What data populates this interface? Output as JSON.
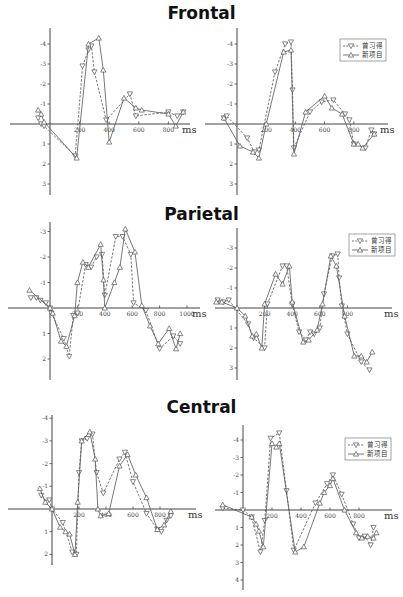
{
  "chart_data": [
    {
      "type": "line",
      "title": "Frontal",
      "panel": "left",
      "xlabel": "ms",
      "ylabel": "",
      "y_inverted": true,
      "xlim": [
        -100,
        1000
      ],
      "ylim": [
        -4.5,
        3.5
      ],
      "x_ticks": [
        200,
        400,
        600,
        800
      ],
      "y_ticks": [
        -4,
        -3,
        -2,
        -1,
        1,
        2,
        3
      ],
      "legend": false,
      "series": [
        {
          "name": "曾习得",
          "style": "dashed",
          "marker": "triangle-down",
          "x": [
            -80,
            -60,
            -40,
            170,
            220,
            260,
            280,
            300,
            380,
            540,
            580,
            800,
            860,
            900
          ],
          "y": [
            -0.3,
            0,
            0.1,
            1.6,
            -2.9,
            -3.7,
            -3.9,
            -2.6,
            -0.2,
            -1.5,
            -0.4,
            -0.6,
            -0.4,
            -0.6
          ]
        },
        {
          "name": "新项目",
          "style": "solid",
          "marker": "triangle-up",
          "x": [
            -80,
            -60,
            -40,
            180,
            260,
            330,
            360,
            400,
            500,
            580,
            620,
            800,
            850,
            900
          ],
          "y": [
            -0.7,
            -0.5,
            -0.1,
            1.7,
            -4.0,
            -4.3,
            -2.7,
            0.9,
            -1.3,
            -0.8,
            -0.7,
            -0.5,
            0.1,
            -0.6
          ]
        }
      ]
    },
    {
      "type": "line",
      "title": "Frontal",
      "panel": "right",
      "xlabel": "ms",
      "ylabel": "",
      "y_inverted": true,
      "xlim": [
        -100,
        1000
      ],
      "ylim": [
        -4.5,
        3.5
      ],
      "x_ticks": [
        200,
        400,
        600,
        800
      ],
      "y_ticks": [
        -4,
        -3,
        -2,
        -1,
        1,
        2,
        3
      ],
      "legend": true,
      "legend_position": "upper right",
      "series": [
        {
          "name": "曾习得",
          "style": "dashed",
          "marker": "triangle-down",
          "x": [
            -90,
            -70,
            70,
            120,
            150,
            260,
            330,
            370,
            380,
            390,
            500,
            580,
            660,
            740,
            770,
            800,
            880,
            920,
            940
          ],
          "y": [
            -0.3,
            -0.4,
            0.7,
            1.4,
            1.3,
            -2.6,
            -4.0,
            -4.1,
            -1.7,
            1.2,
            -0.6,
            -1.1,
            -1.2,
            -0.5,
            -0.2,
            1.0,
            1.2,
            0.3,
            0.5
          ],
          "note": "approximate"
        },
        {
          "name": "新项目",
          "style": "solid",
          "marker": "triangle-up",
          "x": [
            -90,
            20,
            110,
            150,
            200,
            320,
            370,
            390,
            470,
            600,
            650,
            720,
            800,
            830,
            860,
            940
          ],
          "y": [
            -0.3,
            1.1,
            1.4,
            1.7,
            0,
            -3.6,
            -3.7,
            1.5,
            -0.6,
            -1.4,
            -0.8,
            -0.5,
            1.0,
            1.0,
            1.2,
            0.5
          ]
        }
      ]
    },
    {
      "type": "line",
      "title": "Parietal",
      "panel": "left",
      "xlabel": "ms",
      "ylabel": "",
      "y_inverted": true,
      "xlim": [
        -150,
        1100
      ],
      "ylim": [
        -3.3,
        2.8
      ],
      "x_ticks": [
        200,
        400,
        600,
        800,
        1000
      ],
      "y_ticks": [
        -3,
        -2,
        -1,
        1,
        2
      ],
      "legend": false,
      "series": [
        {
          "name": "曾习得",
          "style": "dashed",
          "marker": "triangle-down",
          "x": [
            -140,
            -100,
            -70,
            -30,
            0,
            10,
            100,
            140,
            170,
            200,
            260,
            300,
            340,
            380,
            400,
            480,
            530,
            590,
            610,
            700,
            800,
            900,
            950
          ],
          "y": [
            -0.4,
            -0.4,
            -0.3,
            -0.2,
            0,
            0.2,
            1.2,
            1.9,
            0.3,
            0.2,
            -1.7,
            -1.6,
            -2.0,
            -2.1,
            -0.5,
            -2.8,
            -2.8,
            -2.1,
            -0.2,
            0.1,
            1.6,
            1.1,
            1.4
          ],
          "note": "approximate"
        },
        {
          "name": "新项目",
          "style": "solid",
          "marker": "triangle-up",
          "x": [
            -150,
            0,
            20,
            80,
            120,
            180,
            200,
            240,
            280,
            370,
            390,
            400,
            470,
            510,
            550,
            620,
            670,
            730,
            790,
            870,
            920,
            950
          ],
          "y": [
            -0.7,
            0,
            0.2,
            1.3,
            1.5,
            0.3,
            -1.0,
            -1.8,
            -1.6,
            -2.5,
            -1.1,
            0,
            -1.0,
            -1.6,
            -3.1,
            -2.2,
            -0.1,
            0.7,
            1.4,
            0.8,
            1.6,
            1.0
          ]
        }
      ]
    },
    {
      "type": "line",
      "title": "Parietal",
      "panel": "right",
      "xlabel": "ms",
      "ylabel": "",
      "y_inverted": true,
      "xlim": [
        -150,
        1000
      ],
      "ylim": [
        -3.8,
        3.3
      ],
      "x_ticks": [
        200,
        400,
        600,
        800
      ],
      "y_ticks": [
        -3,
        -2,
        -1,
        1,
        2,
        3
      ],
      "legend": true,
      "legend_position": "upper right",
      "series": [
        {
          "name": "曾习得",
          "style": "dashed",
          "marker": "triangle-down",
          "x": [
            -140,
            -100,
            -60,
            80,
            120,
            200,
            220,
            330,
            360,
            400,
            450,
            500,
            530,
            560,
            600,
            630,
            690,
            730,
            740,
            760,
            800,
            900,
            960
          ],
          "y": [
            -0.4,
            -0.3,
            -0.4,
            0.8,
            1.5,
            2.0,
            -0.2,
            -2.1,
            -2.1,
            -0.2,
            1.2,
            1.6,
            1.2,
            1.3,
            1.0,
            -0.7,
            -2.6,
            -2.7,
            -1.5,
            -0.1,
            1.3,
            2.7,
            3.1
          ],
          "note": "approximate"
        },
        {
          "name": "新项目",
          "style": "solid",
          "marker": "triangle-up",
          "x": [
            -150,
            -110,
            0,
            60,
            110,
            140,
            180,
            200,
            280,
            330,
            380,
            400,
            480,
            520,
            580,
            620,
            680,
            720,
            780,
            850,
            900,
            940,
            980
          ],
          "y": [
            -0.3,
            -0.3,
            0,
            0.4,
            1.4,
            1.3,
            2.0,
            -0.2,
            -1.7,
            -1.2,
            -2.1,
            -0.3,
            1.7,
            1.6,
            1.1,
            -0.2,
            -2.6,
            -2.1,
            0.4,
            2.4,
            2.4,
            2.7,
            2.2
          ]
        }
      ]
    },
    {
      "type": "line",
      "title": "Central",
      "panel": "left",
      "xlabel": "ms",
      "ylabel": "",
      "y_inverted": true,
      "xlim": [
        -100,
        1000
      ],
      "ylim": [
        -4.2,
        2.5
      ],
      "x_ticks": [
        200,
        400,
        600,
        800
      ],
      "y_ticks": [
        -4,
        -3,
        -2,
        -1,
        1,
        2
      ],
      "legend": false,
      "series": [
        {
          "name": "曾习得",
          "style": "dashed",
          "marker": "triangle-down",
          "x": [
            -80,
            -40,
            -20,
            0,
            80,
            150,
            180,
            200,
            220,
            260,
            300,
            330,
            380,
            500,
            540,
            600,
            700,
            780,
            810,
            850,
            880
          ],
          "y": [
            -0.6,
            -0.3,
            -0.4,
            0,
            0.6,
            1.9,
            2.0,
            -1.6,
            -3.0,
            -3.1,
            -3.3,
            -1.6,
            -0.7,
            -2.2,
            -2.5,
            -1.2,
            0.2,
            0.9,
            1.0,
            0.5,
            0.3
          ],
          "note": "approximate"
        },
        {
          "name": "新项目",
          "style": "solid",
          "marker": "triangle-up",
          "x": [
            -90,
            -50,
            0,
            60,
            100,
            130,
            170,
            190,
            220,
            280,
            320,
            340,
            360,
            420,
            500,
            560,
            620,
            700,
            780,
            830,
            880
          ],
          "y": [
            -0.9,
            -0.3,
            0,
            0.8,
            1.0,
            1.1,
            2.0,
            -0.3,
            -3.0,
            -3.4,
            -2.2,
            0,
            0.3,
            0.2,
            -1.9,
            -2.4,
            -1.5,
            -0.5,
            0.9,
            0.7,
            0.1
          ]
        }
      ]
    },
    {
      "type": "line",
      "title": "Central",
      "panel": "right",
      "xlabel": "ms",
      "ylabel": "",
      "y_inverted": true,
      "xlim": [
        -150,
        1000
      ],
      "ylim": [
        -4.5,
        4.2
      ],
      "x_ticks": [
        200,
        400,
        600,
        800
      ],
      "y_ticks": [
        -4,
        -3,
        -2,
        -1,
        1,
        2,
        3,
        4
      ],
      "legend": true,
      "legend_position": "upper right",
      "series": [
        {
          "name": "曾习得",
          "style": "dashed",
          "marker": "triangle-down",
          "x": [
            -140,
            0,
            60,
            120,
            150,
            190,
            250,
            300,
            350,
            500,
            580,
            620,
            680,
            760,
            800,
            840,
            880,
            900
          ],
          "y": [
            -0.1,
            0,
            0.4,
            2.4,
            0.6,
            -4.1,
            -4.4,
            -1.1,
            2.3,
            -0.4,
            -1.5,
            -2.0,
            -0.9,
            0.8,
            1.6,
            1.5,
            2.0,
            1.0
          ],
          "note": "approximate"
        },
        {
          "name": "新项目",
          "style": "solid",
          "marker": "triangle-up",
          "x": [
            -140,
            60,
            90,
            110,
            140,
            200,
            230,
            250,
            360,
            420,
            530,
            560,
            600,
            620,
            700,
            780,
            820,
            860,
            900,
            920
          ],
          "y": [
            -0.3,
            0.4,
            0.8,
            1.2,
            2.1,
            -3.8,
            -3.6,
            -3.8,
            2.4,
            2.1,
            -0.4,
            -1.0,
            -1.4,
            -1.8,
            0,
            1.3,
            1.6,
            1.5,
            1.6,
            1.3
          ]
        }
      ]
    }
  ],
  "titles": {
    "frontal": "Frontal",
    "parietal": "Parietal",
    "central": "Central"
  },
  "legend": {
    "item1": "曾习得",
    "item2": "新项目"
  },
  "unit": "ms"
}
